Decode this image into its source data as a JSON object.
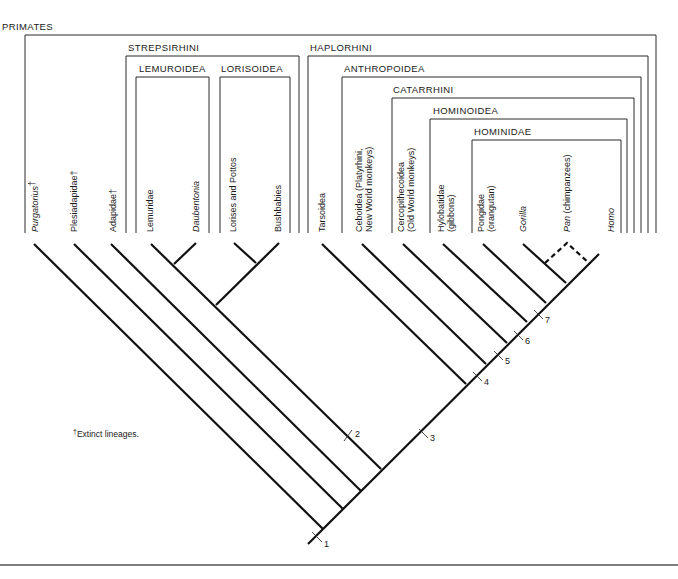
{
  "groups": {
    "primates": "PRIMATES",
    "strepsirhini": "STREPSIRHINI",
    "lemuroidea": "LEMUROIDEA",
    "lorisoidea": "LORISOIDEA",
    "haplorhini": "HAPLORHINI",
    "anthropoidea": "ANTHROPOIDEA",
    "catarrhini": "CATARRHINI",
    "hominoidea": "HOMINOIDEA",
    "hominidae": "HOMINIDAE"
  },
  "taxa": {
    "purgatorius": "Purgatorius",
    "purgatorius_mark": "†",
    "plesiadapidae": "Plesiadapidae†",
    "adapidae": "Adapidae†",
    "lemuridae": "Lemuridae",
    "daubentonia": "Daubentonia",
    "lorises": "Lorises and Pottos",
    "bushbabies": "Bushbabies",
    "tarsoidea": "Tarsoidea",
    "ceboidea_1": "Ceboidea (Platyrhini,",
    "ceboidea_2": "New World monkeys)",
    "cercopith_1": "Cercopithecoidea",
    "cercopith_2": "(Old World monkeys)",
    "hylobatidae_1": "Hylobatidae",
    "hylobatidae_2": "(gibbons)",
    "pongidae_1": "Pongidae",
    "pongidae_2": "(orangutan)",
    "gorilla": "Gorilla",
    "pan": "Pan",
    "pan_note": " (chimpanzees)",
    "homo": "Homo"
  },
  "markers": [
    "1",
    "2",
    "3",
    "4",
    "5",
    "6",
    "7"
  ],
  "footnote": {
    "dagger": "†",
    "text": "Extinct lineages."
  }
}
